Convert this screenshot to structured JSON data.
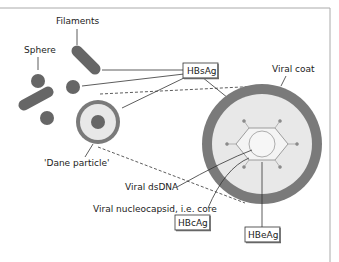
{
  "diagram": {
    "labels": {
      "filaments": "Filaments",
      "sphere": "Sphere",
      "hbsag": "HBsAg",
      "viral_coat": "Viral coat",
      "dane_particle": "'Dane particle'",
      "viral_dsdna": "Viral dsDNA",
      "viral_nucleocapsid": "Viral nucleocapsid, i.e. core",
      "hbcag": "HBcAg",
      "hbeag": "HBeAg"
    },
    "colors": {
      "particle": "#666666",
      "coat": "#7a7a7a",
      "interior": "#e8e8e8",
      "frame": "#aaaaaa",
      "line": "#333333"
    }
  }
}
